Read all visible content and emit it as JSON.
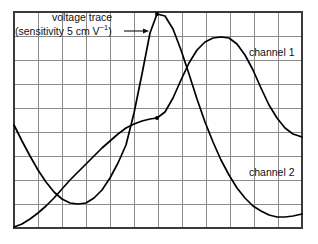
{
  "figure": {
    "kind": "oscilloscope-screen",
    "annotations": {
      "voltage_trace": "voltage trace",
      "sensitivity_prefix": "(sensitivity 5 cm V",
      "sensitivity_exponent": "−1",
      "sensitivity_suffix": ")",
      "sensitivity_full": "(sensitivity 5 cm V−1)",
      "channel_1": "channel 1",
      "channel_2": "channel 2"
    },
    "colors": {
      "background": "#ffffff",
      "grid_line": "#8a8a8a",
      "grid_border": "#3a3a3a",
      "trace": "#000000",
      "text": "#111111"
    },
    "grid": {
      "columns": 12,
      "rows": 9,
      "cell_px": 24,
      "left": 14,
      "top": 12,
      "right": 302,
      "bottom": 228
    }
  },
  "chart_data": {
    "type": "line",
    "title": "",
    "xlabel": "",
    "ylabel": "",
    "grid": true,
    "legend": "inline-annotations",
    "xlim": [
      0,
      12
    ],
    "ylim": [
      0,
      9
    ],
    "axis_units": "grid divisions (1 division = 24 px)",
    "markers": [
      {
        "name": "channel-1-peak-dot",
        "x_px": 157,
        "y_px": 14
      },
      {
        "name": "channel-2-midpoint-dot",
        "x_px": 157,
        "y_px": 118
      }
    ],
    "series": [
      {
        "name": "channel 1",
        "description": "inverted-cosine voltage trace: starts mid-left, dips to minimum, rises to a peak near the top centre, then falls to the bottom right",
        "points_px": [
          [
            14,
            125
          ],
          [
            22,
            141
          ],
          [
            30,
            156
          ],
          [
            38,
            170
          ],
          [
            46,
            182
          ],
          [
            54,
            192
          ],
          [
            62,
            199
          ],
          [
            70,
            203
          ],
          [
            78,
            204
          ],
          [
            86,
            203
          ],
          [
            94,
            198
          ],
          [
            102,
            190
          ],
          [
            110,
            178
          ],
          [
            118,
            163
          ],
          [
            126,
            145
          ],
          [
            134,
            113
          ],
          [
            142,
            74
          ],
          [
            150,
            33
          ],
          [
            157,
            14
          ],
          [
            165,
            16
          ],
          [
            173,
            29
          ],
          [
            181,
            50
          ],
          [
            189,
            74
          ],
          [
            197,
            99
          ],
          [
            205,
            122
          ],
          [
            213,
            142
          ],
          [
            221,
            160
          ],
          [
            229,
            175
          ],
          [
            237,
            188
          ],
          [
            245,
            198
          ],
          [
            253,
            206
          ],
          [
            261,
            211
          ],
          [
            269,
            215
          ],
          [
            277,
            217
          ],
          [
            285,
            217
          ],
          [
            293,
            216
          ],
          [
            302,
            214
          ]
        ]
      },
      {
        "name": "channel 2",
        "description": "sine-like voltage trace, phase-shifted later: starts at bottom-left, rises through mid-screen, peaks right of centre, then falls toward the right edge",
        "points_px": [
          [
            14,
            227
          ],
          [
            22,
            224
          ],
          [
            30,
            219
          ],
          [
            38,
            213
          ],
          [
            46,
            206
          ],
          [
            54,
            198
          ],
          [
            62,
            189
          ],
          [
            70,
            180
          ],
          [
            78,
            172
          ],
          [
            86,
            164
          ],
          [
            94,
            156
          ],
          [
            102,
            148
          ],
          [
            110,
            141
          ],
          [
            118,
            134
          ],
          [
            126,
            128
          ],
          [
            134,
            124
          ],
          [
            142,
            121
          ],
          [
            150,
            119
          ],
          [
            157,
            118
          ],
          [
            165,
            112
          ],
          [
            173,
            98
          ],
          [
            181,
            80
          ],
          [
            189,
            63
          ],
          [
            197,
            50
          ],
          [
            205,
            42
          ],
          [
            213,
            38
          ],
          [
            221,
            37
          ],
          [
            229,
            38
          ],
          [
            237,
            44
          ],
          [
            245,
            55
          ],
          [
            253,
            70
          ],
          [
            261,
            88
          ],
          [
            269,
            105
          ],
          [
            277,
            118
          ],
          [
            285,
            128
          ],
          [
            293,
            134
          ],
          [
            302,
            137
          ]
        ]
      }
    ],
    "arrow": {
      "name": "sensitivity-pointer-arrow",
      "from_px": [
        124,
        31
      ],
      "to_px": [
        146,
        31
      ],
      "points_to": "channel 1 trace"
    }
  }
}
